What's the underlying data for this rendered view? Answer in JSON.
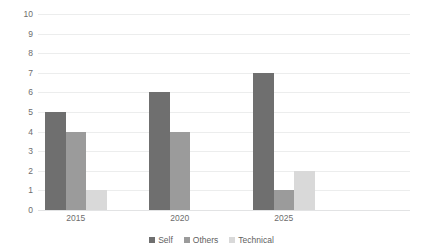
{
  "chart_data": {
    "type": "bar",
    "title": "",
    "subtitle": "",
    "xlabel": "",
    "ylabel": "",
    "categories": [
      "2015",
      "2020",
      "2025"
    ],
    "series": [
      {
        "name": "Self",
        "values": [
          5,
          6,
          7
        ],
        "color": "#6f6f6f"
      },
      {
        "name": "Others",
        "values": [
          4,
          4,
          1
        ],
        "color": "#9b9b9b"
      },
      {
        "name": "Technical",
        "values": [
          1,
          0,
          2
        ],
        "color": "#d9d9d9"
      }
    ],
    "ylim": [
      0,
      10
    ],
    "ytick_labels": [
      "0",
      "1",
      "2",
      "3",
      "4",
      "5",
      "6",
      "7",
      "8",
      "9",
      "10"
    ],
    "ytick_values": [
      0,
      1,
      2,
      3,
      4,
      5,
      6,
      7,
      8,
      9,
      10
    ],
    "grid": true,
    "grid_axis": "y",
    "grid_color": "#eceded",
    "legend": true,
    "legend_position": "bottom",
    "background_color": "#ffffff",
    "axis_text_color": "#6d6d6d"
  }
}
